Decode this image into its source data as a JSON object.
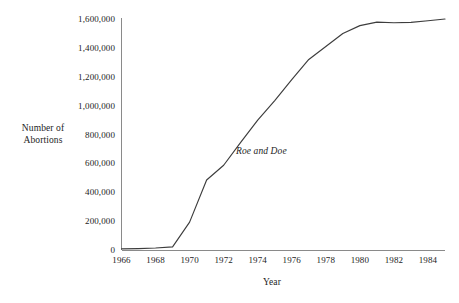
{
  "chart_data": {
    "type": "line",
    "title": "",
    "xlabel": "Year",
    "ylabel": "Number of\nAbortions",
    "ylabel_lines": [
      "Number of",
      "Abortions"
    ],
    "xlim": [
      1966,
      1985
    ],
    "ylim": [
      0,
      1600000
    ],
    "grid": false,
    "legend": null,
    "y_ticks": [
      0,
      200000,
      400000,
      600000,
      800000,
      1000000,
      1200000,
      1400000,
      1600000
    ],
    "y_tick_labels": [
      "0",
      "200,000",
      "400,000",
      "600,000",
      "800,000",
      "1,000,000",
      "1,200,000",
      "1,400,000",
      "1,600,000"
    ],
    "x_ticks": [
      1966,
      1968,
      1970,
      1972,
      1974,
      1976,
      1978,
      1980,
      1982,
      1984
    ],
    "x_tick_labels": [
      "1966",
      "1968",
      "1970",
      "1972",
      "1974",
      "1976",
      "1978",
      "1980",
      "1982",
      "1984"
    ],
    "series": [
      {
        "name": "Number of Abortions",
        "color": "#3d3d3d",
        "x": [
          1966,
          1967,
          1968,
          1969,
          1970,
          1971,
          1972,
          1973,
          1974,
          1975,
          1976,
          1977,
          1978,
          1979,
          1980,
          1981,
          1982,
          1983,
          1984,
          1985
        ],
        "values": [
          8000,
          10000,
          14000,
          22000,
          193000,
          485000,
          587000,
          745000,
          900000,
          1035000,
          1180000,
          1320000,
          1410000,
          1500000,
          1554000,
          1578000,
          1574000,
          1577000,
          1588000,
          1600000
        ]
      }
    ],
    "annotations": [
      {
        "text": "Roe and Doe",
        "style": "italic",
        "x": 1972.8,
        "y": 700000
      }
    ],
    "axis_color": "#8a8a8a",
    "line_color": "#3d3d3d",
    "background": "#ffffff"
  }
}
